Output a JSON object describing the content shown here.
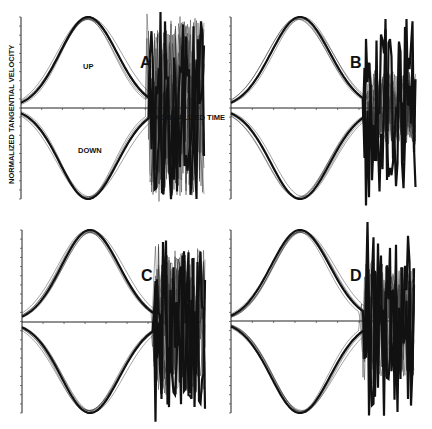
{
  "figure": {
    "ylabel": "NORMALIZED TANGENTIAL VELOCITY",
    "xlabel": "NORMALIZED TIME",
    "curve_labels": {
      "up": "UP",
      "down": "DOWN"
    },
    "colors": {
      "ink": "#111111",
      "background": "#ffffff"
    }
  },
  "panels": [
    {
      "id": "A",
      "label": "A",
      "origin_x": 21,
      "top_y": 17,
      "baseline_y": 108,
      "bottom_y": 199,
      "peak_x": 88,
      "end_x": 205,
      "tail_noise": 0.05,
      "show_labels": true
    },
    {
      "id": "B",
      "label": "B",
      "origin_x": 231,
      "top_y": 17,
      "baseline_y": 108,
      "bottom_y": 199,
      "peak_x": 300,
      "end_x": 416,
      "tail_noise": 0.02,
      "show_labels": false
    },
    {
      "id": "C",
      "label": "C",
      "origin_x": 22,
      "top_y": 230,
      "baseline_y": 322,
      "bottom_y": 413,
      "peak_x": 90,
      "end_x": 206,
      "tail_noise": 0.04,
      "show_labels": false
    },
    {
      "id": "D",
      "label": "D",
      "origin_x": 231,
      "top_y": 230,
      "baseline_y": 321,
      "bottom_y": 413,
      "peak_x": 300,
      "end_x": 415,
      "tail_noise": 0.03,
      "show_labels": false
    }
  ],
  "chart_data": [
    {
      "type": "line",
      "title": "A",
      "xlabel": "NORMALIZED TIME",
      "ylabel": "NORMALIZED TANGENTIAL VELOCITY",
      "series": [
        {
          "name": "UP",
          "shape": "bell",
          "peak_time": 0.37,
          "peak_value": 1.0
        },
        {
          "name": "DOWN",
          "shape": "bell",
          "peak_time": 0.37,
          "peak_value": -1.0
        }
      ],
      "x": [
        0.0,
        0.1,
        0.2,
        0.3,
        0.37,
        0.45,
        0.55,
        0.65,
        0.75,
        0.85,
        1.0
      ],
      "annotations": [
        "UP",
        "DOWN",
        "NORMALIZED TIME"
      ],
      "ylim": [
        -1,
        1
      ],
      "grid": false
    },
    {
      "type": "line",
      "title": "B",
      "series": [
        {
          "name": "UP",
          "shape": "bell",
          "peak_time": 0.37,
          "peak_value": 1.0
        },
        {
          "name": "DOWN",
          "shape": "bell",
          "peak_time": 0.37,
          "peak_value": -1.0
        }
      ],
      "ylim": [
        -1,
        1
      ],
      "grid": false
    },
    {
      "type": "line",
      "title": "C",
      "series": [
        {
          "name": "UP",
          "shape": "bell",
          "peak_time": 0.37,
          "peak_value": 1.0
        },
        {
          "name": "DOWN",
          "shape": "bell",
          "peak_time": 0.37,
          "peak_value": -1.0
        }
      ],
      "ylim": [
        -1,
        1
      ],
      "grid": false
    },
    {
      "type": "line",
      "title": "D",
      "series": [
        {
          "name": "UP",
          "shape": "bell",
          "peak_time": 0.37,
          "peak_value": 1.0
        },
        {
          "name": "DOWN",
          "shape": "bell",
          "peak_time": 0.37,
          "peak_value": -1.0
        }
      ],
      "ylim": [
        -1,
        1
      ],
      "grid": false
    }
  ]
}
